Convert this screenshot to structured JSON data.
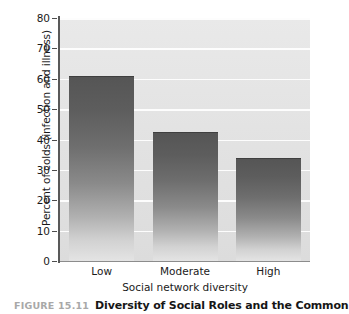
{
  "chart_data": {
    "type": "bar",
    "title": "Diversity of Social Roles and the Common",
    "categories": [
      "Low",
      "Moderate",
      "High"
    ],
    "values": [
      61,
      42.5,
      33.8
    ],
    "xlabel": "Social network diversity",
    "ylabel": "Percent of colds (infection and illness)",
    "ylim": [
      0,
      80
    ],
    "yticks": [
      0,
      10,
      20,
      30,
      40,
      50,
      60,
      70,
      80
    ],
    "ytick_labels": [
      "0",
      "10",
      "20",
      "30",
      "40",
      "50",
      "60",
      "70",
      "80"
    ],
    "grid": true,
    "grid_axis": "y",
    "legend": false,
    "bar_style": "vertical-gradient-dark-to-light",
    "plot_background": "#e4e4e4",
    "gridline_color": "#fdfdfd",
    "axis_color": "#595959",
    "text_color": "#1a1a1a"
  },
  "caption": {
    "figure_number": "FIGURE 15.11",
    "title": "Diversity of Social Roles and the Common",
    "figure_number_color": "#a8a8a8",
    "title_color": "#161616"
  }
}
